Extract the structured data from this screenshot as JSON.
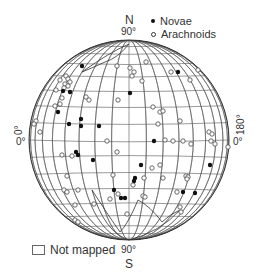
{
  "labels": {
    "north_letter": "N",
    "north_deg": "90°",
    "south_letter": "S",
    "south_deg": "90°",
    "left_rot": "0°",
    "left_deg": "0°",
    "right_rot": "180°",
    "right_deg": "0°"
  },
  "legend": {
    "novae": "Novae",
    "arachnoids": "Arachnoids",
    "not_mapped": "Not mapped"
  },
  "colors": {
    "grid": "#555555",
    "outline": "#333333",
    "novae_fill": "#111111",
    "arachnoid_stroke": "#444444"
  },
  "globe": {
    "cx": 129,
    "cy": 140,
    "r": 100
  },
  "novae": [
    [
      82,
      66
    ],
    [
      178,
      72
    ],
    [
      63,
      91
    ],
    [
      70,
      92
    ],
    [
      130,
      93
    ],
    [
      58,
      112
    ],
    [
      69,
      124
    ],
    [
      81,
      119
    ],
    [
      81,
      126
    ],
    [
      99,
      126
    ],
    [
      154,
      141
    ],
    [
      76,
      152
    ],
    [
      78,
      155
    ],
    [
      93,
      160
    ],
    [
      141,
      165
    ],
    [
      135,
      178
    ],
    [
      114,
      190
    ],
    [
      134,
      181
    ],
    [
      121,
      198
    ],
    [
      125,
      198
    ],
    [
      183,
      192
    ],
    [
      195,
      193
    ],
    [
      210,
      165
    ]
  ],
  "arachnoids": [
    [
      117,
      66
    ],
    [
      130,
      68
    ],
    [
      132,
      76
    ],
    [
      134,
      72
    ],
    [
      146,
      62
    ],
    [
      142,
      81
    ],
    [
      171,
      72
    ],
    [
      190,
      80
    ],
    [
      198,
      70
    ],
    [
      60,
      80
    ],
    [
      66,
      76
    ],
    [
      68,
      79
    ],
    [
      70,
      82
    ],
    [
      65,
      84
    ],
    [
      68,
      86
    ],
    [
      64,
      88
    ],
    [
      56,
      90
    ],
    [
      62,
      98
    ],
    [
      55,
      106
    ],
    [
      86,
      97
    ],
    [
      89,
      100
    ],
    [
      60,
      104
    ],
    [
      118,
      100
    ],
    [
      153,
      107
    ],
    [
      160,
      112
    ],
    [
      163,
      111
    ],
    [
      180,
      121
    ],
    [
      158,
      124
    ],
    [
      36,
      121
    ],
    [
      34,
      124
    ],
    [
      40,
      132
    ],
    [
      107,
      141
    ],
    [
      165,
      140
    ],
    [
      173,
      141
    ],
    [
      183,
      141
    ],
    [
      191,
      144
    ],
    [
      209,
      132
    ],
    [
      212,
      134
    ],
    [
      211,
      141
    ],
    [
      215,
      144
    ],
    [
      228,
      147
    ],
    [
      117,
      152
    ],
    [
      62,
      155
    ],
    [
      72,
      156
    ],
    [
      152,
      168
    ],
    [
      160,
      165
    ],
    [
      113,
      175
    ],
    [
      163,
      178
    ],
    [
      186,
      176
    ],
    [
      188,
      177
    ],
    [
      67,
      176
    ],
    [
      144,
      178
    ],
    [
      110,
      199
    ],
    [
      133,
      185
    ],
    [
      64,
      190
    ],
    [
      67,
      192
    ],
    [
      78,
      190
    ],
    [
      118,
      194
    ],
    [
      143,
      196
    ],
    [
      145,
      197
    ],
    [
      177,
      192
    ],
    [
      187,
      179
    ],
    [
      75,
      205
    ],
    [
      94,
      204
    ],
    [
      127,
      214
    ],
    [
      181,
      212
    ],
    [
      180,
      207
    ],
    [
      75,
      220
    ],
    [
      78,
      222
    ]
  ]
}
